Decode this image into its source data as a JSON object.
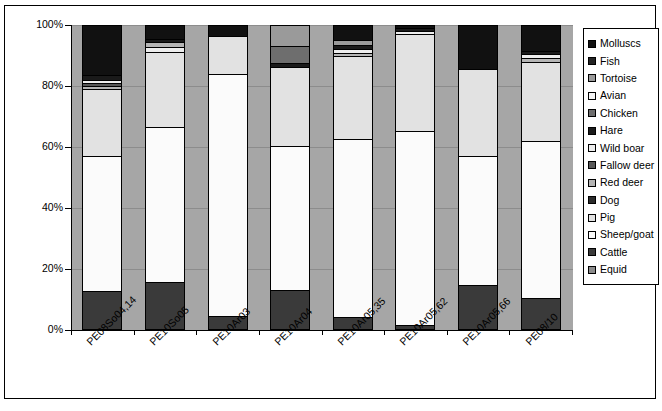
{
  "chart_data": {
    "type": "bar",
    "subtype": "stacked-100-percent",
    "title": "",
    "xlabel": "",
    "ylabel": "",
    "ylim": [
      0,
      100
    ],
    "ytick_labels": [
      "0%",
      "20%",
      "40%",
      "60%",
      "80%",
      "100%"
    ],
    "ytick_values": [
      0,
      20,
      40,
      60,
      80,
      100
    ],
    "grid": true,
    "legend_position": "right",
    "categories": [
      "PE08So04,14",
      "PE10So05",
      "PE10Ar03",
      "PE10Ar04",
      "PE10Ar05,35",
      "PE10Ar05,62",
      "PE10Ar05,66",
      "PE08/10"
    ],
    "series": [
      {
        "name": "Equid",
        "color": "#8c8c8c",
        "values": [
          0.0,
          0.0,
          0.0,
          0.0,
          0.0,
          0.0,
          0.0,
          0.0
        ]
      },
      {
        "name": "Cattle",
        "color": "#3a3a3a",
        "values": [
          12.8,
          15.8,
          4.6,
          13.1,
          4.2,
          1.6,
          14.6,
          10.6
        ]
      },
      {
        "name": "Sheep/goat",
        "color": "#fbfbfb",
        "values": [
          44.4,
          50.9,
          79.4,
          47.2,
          58.3,
          63.5,
          42.6,
          51.5
        ]
      },
      {
        "name": "Pig",
        "color": "#e2e2e2",
        "values": [
          21.9,
          31.0,
          15.2,
          25.9,
          27.2,
          32.1,
          28.4,
          25.8
        ]
      },
      {
        "name": "Dog",
        "color": "#2b2b2b",
        "values": [
          0.0,
          0.0,
          0.0,
          0.0,
          0.0,
          0.0,
          0.0,
          0.0
        ]
      },
      {
        "name": "Red deer",
        "color": "#b5b5b5",
        "values": [
          1.0,
          0.6,
          0.0,
          0.0,
          1.1,
          0.5,
          0.0,
          1.2
        ]
      },
      {
        "name": "Fallow deer",
        "color": "#575757",
        "values": [
          0.8,
          0.0,
          0.0,
          0.0,
          0.0,
          0.0,
          0.0,
          0.0
        ]
      },
      {
        "name": "Wild boar",
        "color": "#ededed",
        "values": [
          1.2,
          1.3,
          0.0,
          0.0,
          1.4,
          0.7,
          0.0,
          1.3
        ]
      },
      {
        "name": "Hare",
        "color": "#1a1a1a",
        "values": [
          1.5,
          0.9,
          0.0,
          0.0,
          1.3,
          0.6,
          0.0,
          1.1
        ]
      },
      {
        "name": "Chicken",
        "color": "#6e6e6e",
        "values": [
          0.0,
          0.0,
          0.0,
          5.5,
          0.0,
          0.0,
          0.0,
          0.0
        ]
      },
      {
        "name": "Avian",
        "color": "#f5f5f5",
        "values": [
          0.0,
          0.0,
          0.0,
          0.0,
          0.0,
          0.0,
          0.0,
          0.0
        ]
      },
      {
        "name": "Tortoise",
        "color": "#9a9a9a",
        "values": [
          0.0,
          0.0,
          0.0,
          0.0,
          0.0,
          0.0,
          0.0,
          0.0
        ]
      },
      {
        "name": "Fish",
        "color": "#232323",
        "values": [
          0.0,
          0.0,
          0.0,
          0.0,
          0.0,
          0.0,
          0.0,
          0.0
        ]
      },
      {
        "name": "Molluscs",
        "color": "#111111",
        "values": [
          16.4,
          0.0,
          0.8,
          8.3,
          6.5,
          1.0,
          14.4,
          8.5
        ]
      }
    ],
    "bars": [
      {
        "category": "PE08So04,14",
        "segments": [
          {
            "name": "Cattle",
            "color": "#3a3a3a",
            "value": 12.8
          },
          {
            "name": "Sheep/goat",
            "color": "#fbfbfb",
            "value": 44.4
          },
          {
            "name": "Pig",
            "color": "#e2e2e2",
            "value": 21.9
          },
          {
            "name": "Red deer",
            "color": "#b5b5b5",
            "value": 1.0
          },
          {
            "name": "Fallow deer",
            "color": "#575757",
            "value": 0.8
          },
          {
            "name": "Wild boar",
            "color": "#ededed",
            "value": 1.2
          },
          {
            "name": "Hare",
            "color": "#1a1a1a",
            "value": 1.5
          },
          {
            "name": "Molluscs",
            "color": "#111111",
            "value": 16.4
          }
        ]
      },
      {
        "category": "PE10So05",
        "segments": [
          {
            "name": "Cattle",
            "color": "#3a3a3a",
            "value": 15.8
          },
          {
            "name": "Sheep/goat",
            "color": "#fbfbfb",
            "value": 50.9
          },
          {
            "name": "Pig",
            "color": "#e2e2e2",
            "value": 24.6
          },
          {
            "name": "Wild boar",
            "color": "#ededed",
            "value": 1.6
          },
          {
            "name": "Red deer",
            "color": "#b5b5b5",
            "value": 1.4
          },
          {
            "name": "Hare",
            "color": "#1a1a1a",
            "value": 1.2
          },
          {
            "name": "Molluscs",
            "color": "#111111",
            "value": 4.5
          }
        ]
      },
      {
        "category": "PE10Ar03",
        "segments": [
          {
            "name": "Cattle",
            "color": "#3a3a3a",
            "value": 4.6
          },
          {
            "name": "Sheep/goat",
            "color": "#fbfbfb",
            "value": 79.4
          },
          {
            "name": "Pig",
            "color": "#e2e2e2",
            "value": 12.3
          },
          {
            "name": "Molluscs",
            "color": "#111111",
            "value": 3.7
          }
        ]
      },
      {
        "category": "PE10Ar04",
        "segments": [
          {
            "name": "Cattle",
            "color": "#3a3a3a",
            "value": 13.1
          },
          {
            "name": "Sheep/goat",
            "color": "#fbfbfb",
            "value": 47.2
          },
          {
            "name": "Pig",
            "color": "#e2e2e2",
            "value": 25.9
          },
          {
            "name": "Hare",
            "color": "#1a1a1a",
            "value": 1.4
          },
          {
            "name": "Chicken",
            "color": "#6e6e6e",
            "value": 5.5
          },
          {
            "name": "Tortoise",
            "color": "#9a9a9a",
            "value": 6.9
          }
        ]
      },
      {
        "category": "PE10Ar05,35",
        "segments": [
          {
            "name": "Cattle",
            "color": "#3a3a3a",
            "value": 4.2
          },
          {
            "name": "Sheep/goat",
            "color": "#fbfbfb",
            "value": 58.3
          },
          {
            "name": "Pig",
            "color": "#e2e2e2",
            "value": 27.2
          },
          {
            "name": "Red deer",
            "color": "#b5b5b5",
            "value": 1.1
          },
          {
            "name": "Wild boar",
            "color": "#ededed",
            "value": 1.4
          },
          {
            "name": "Hare",
            "color": "#1a1a1a",
            "value": 1.3
          },
          {
            "name": "Tortoise",
            "color": "#9a9a9a",
            "value": 1.6
          },
          {
            "name": "Molluscs",
            "color": "#111111",
            "value": 4.9
          }
        ]
      },
      {
        "category": "PE10Ar05,62",
        "segments": [
          {
            "name": "Cattle",
            "color": "#3a3a3a",
            "value": 1.6
          },
          {
            "name": "Sheep/goat",
            "color": "#fbfbfb",
            "value": 63.5
          },
          {
            "name": "Pig",
            "color": "#e2e2e2",
            "value": 32.1
          },
          {
            "name": "Wild boar",
            "color": "#ededed",
            "value": 0.7
          },
          {
            "name": "Hare",
            "color": "#1a1a1a",
            "value": 1.1
          },
          {
            "name": "Molluscs",
            "color": "#111111",
            "value": 1.0
          }
        ]
      },
      {
        "category": "PE10Ar05,66",
        "segments": [
          {
            "name": "Cattle",
            "color": "#3a3a3a",
            "value": 14.6
          },
          {
            "name": "Sheep/goat",
            "color": "#fbfbfb",
            "value": 42.6
          },
          {
            "name": "Pig",
            "color": "#e2e2e2",
            "value": 28.4
          },
          {
            "name": "Molluscs",
            "color": "#111111",
            "value": 14.4
          }
        ]
      },
      {
        "category": "PE08/10",
        "segments": [
          {
            "name": "Cattle",
            "color": "#3a3a3a",
            "value": 10.6
          },
          {
            "name": "Sheep/goat",
            "color": "#fbfbfb",
            "value": 51.5
          },
          {
            "name": "Pig",
            "color": "#e2e2e2",
            "value": 25.8
          },
          {
            "name": "Red deer",
            "color": "#b5b5b5",
            "value": 1.2
          },
          {
            "name": "Wild boar",
            "color": "#ededed",
            "value": 1.3
          },
          {
            "name": "Hare",
            "color": "#1a1a1a",
            "value": 1.1
          },
          {
            "name": "Molluscs",
            "color": "#111111",
            "value": 8.5
          }
        ]
      }
    ],
    "legend_entries": [
      {
        "label": "Molluscs",
        "color": "#111111"
      },
      {
        "label": "Fish",
        "color": "#232323"
      },
      {
        "label": "Tortoise",
        "color": "#9a9a9a"
      },
      {
        "label": "Avian",
        "color": "#f5f5f5"
      },
      {
        "label": "Chicken",
        "color": "#6e6e6e"
      },
      {
        "label": "Hare",
        "color": "#1a1a1a"
      },
      {
        "label": "Wild boar",
        "color": "#ededed"
      },
      {
        "label": "Fallow deer",
        "color": "#575757"
      },
      {
        "label": "Red deer",
        "color": "#b5b5b5"
      },
      {
        "label": "Dog",
        "color": "#2b2b2b"
      },
      {
        "label": "Pig",
        "color": "#e2e2e2"
      },
      {
        "label": "Sheep/goat",
        "color": "#fbfbfb"
      },
      {
        "label": "Cattle",
        "color": "#3a3a3a"
      },
      {
        "label": "Equid",
        "color": "#8c8c8c"
      }
    ],
    "plot_background": "#a6a6a6",
    "gridline_color": "#8c8c8c",
    "axis_color": "#000000"
  }
}
